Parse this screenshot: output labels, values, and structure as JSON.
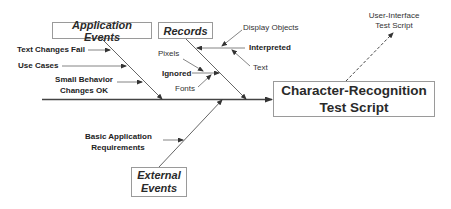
{
  "diagram": {
    "type": "fishbone",
    "effect": {
      "line1": "Character-Recognition",
      "line2": "Test Script"
    },
    "categories": {
      "application_events": {
        "label": "Application Events",
        "causes": [
          "Text Changes Fail",
          "Use Cases",
          "Small Behavior",
          "Changes OK"
        ]
      },
      "records": {
        "label": "Records",
        "causes": {
          "ignored": {
            "label": "Ignored",
            "subcauses": [
              "Pixels",
              "Fonts"
            ]
          },
          "interpreted": {
            "label": "Interpreted",
            "subcauses": [
              "Display Objects",
              "Text"
            ]
          }
        }
      },
      "external_events": {
        "label_line1": "External",
        "label_line2": "Events",
        "causes": [
          "Basic Application",
          "Requirements"
        ]
      }
    },
    "output": {
      "line1": "User-Interface",
      "line2": "Test Script"
    },
    "colors": {
      "line": "#555555",
      "box_border": "#9a9a9a",
      "text": "#2a2a2a"
    }
  }
}
